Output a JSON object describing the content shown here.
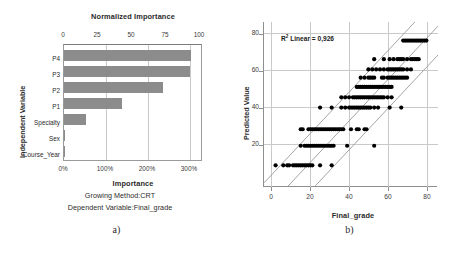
{
  "figure": {
    "panel_a_letter": "a)",
    "panel_b_letter": "b)"
  },
  "panel_a": {
    "top_axis_title": "Normalized Importance",
    "bottom_axis_title": "Importance",
    "y_axis_title": "Independent Variable",
    "caption_line1": "Growing Method:CRT",
    "caption_line2": "Dependent Variable:Final_grade",
    "top_ticks": [
      "0",
      "25",
      "50",
      "75",
      "100"
    ],
    "bottom_ticks": [
      "0%",
      "100%",
      "200%",
      "300%"
    ]
  },
  "panel_b": {
    "x_axis_title": "Final_grade",
    "y_axis_title": "Predicted Value",
    "r2_prefix": "R",
    "r2_sup": "2",
    "r2_text": " Linear = 0,926",
    "x_ticks": [
      "0",
      "20",
      "40",
      "60",
      "80"
    ],
    "y_ticks": [
      "20",
      "40",
      "60",
      "80"
    ]
  },
  "colors": {
    "bar_fill": "#8c8c8c",
    "grid": "#c9c9c9",
    "axis": "#8e8e8e",
    "point": "#000000",
    "text": "#2b2b2b"
  },
  "chart_data": [
    {
      "type": "bar",
      "title": "Normalized Importance",
      "orientation": "horizontal",
      "xlabel": "Importance",
      "ylabel": "Independent Variable",
      "secondary_xlabel": "Normalized Importance",
      "categories": [
        "P4",
        "P3",
        "P2",
        "P1",
        "Specialty",
        "Sex",
        "Course_Year"
      ],
      "values": [
        305,
        303,
        238,
        140,
        53,
        3,
        0
      ],
      "values_normalized": [
        100.0,
        99.3,
        78.0,
        45.9,
        17.4,
        1.0,
        0.0
      ],
      "xlim": [
        0,
        330
      ],
      "xticks": [
        0,
        100,
        200,
        300
      ],
      "xticklabels": [
        "0%",
        "100%",
        "200%",
        "300%"
      ],
      "secondary_xlim": [
        0,
        108
      ],
      "secondary_xticks": [
        0,
        25,
        50,
        75,
        100
      ],
      "secondary_xticklabels": [
        "0",
        "25",
        "50",
        "75",
        "100"
      ],
      "grid": "vertical",
      "legend": "none",
      "annotations": [
        "Growing Method:CRT",
        "Dependent Variable:Final_grade"
      ]
    },
    {
      "type": "scatter",
      "title": "",
      "xlabel": "Final_grade",
      "ylabel": "Predicted Value",
      "xlim": [
        -4,
        86
      ],
      "ylim": [
        8,
        88
      ],
      "xticks": [
        0,
        20,
        40,
        60,
        80
      ],
      "yticks": [
        20,
        40,
        60,
        80
      ],
      "grid": "both",
      "legend": "none",
      "annotation": "R2 Linear = 0,926",
      "r_squared": 0.926,
      "fit_line": {
        "slope": 1.0,
        "intercept": 0.0
      },
      "band_offsets": [
        -14,
        0,
        14
      ],
      "points": [
        [
          2,
          18.5
        ],
        [
          6,
          18.5
        ],
        [
          8,
          18.5
        ],
        [
          9,
          18.5
        ],
        [
          11,
          18.5
        ],
        [
          12,
          18.5
        ],
        [
          13,
          18.5
        ],
        [
          14,
          18.5
        ],
        [
          15,
          18.5
        ],
        [
          16,
          18.5
        ],
        [
          17,
          18.5
        ],
        [
          18,
          18.5
        ],
        [
          19,
          18.5
        ],
        [
          20,
          18.5
        ],
        [
          21,
          18.5
        ],
        [
          25,
          18.5
        ],
        [
          31,
          18.5
        ],
        [
          15,
          28
        ],
        [
          17,
          28
        ],
        [
          18,
          28
        ],
        [
          19,
          28
        ],
        [
          20,
          28
        ],
        [
          21,
          28
        ],
        [
          22,
          28
        ],
        [
          23,
          28
        ],
        [
          24,
          28
        ],
        [
          25,
          28
        ],
        [
          26,
          28
        ],
        [
          27,
          28
        ],
        [
          28,
          28
        ],
        [
          29,
          28
        ],
        [
          30,
          28
        ],
        [
          31,
          28
        ],
        [
          32,
          28
        ],
        [
          39,
          28
        ],
        [
          53,
          28
        ],
        [
          15,
          36
        ],
        [
          16,
          36
        ],
        [
          19,
          36
        ],
        [
          20,
          36
        ],
        [
          21,
          36
        ],
        [
          22,
          36
        ],
        [
          23,
          36
        ],
        [
          24,
          36
        ],
        [
          25,
          36
        ],
        [
          26,
          36
        ],
        [
          27,
          36
        ],
        [
          28,
          36
        ],
        [
          29,
          36
        ],
        [
          30,
          36
        ],
        [
          31,
          36
        ],
        [
          32,
          36
        ],
        [
          33,
          36
        ],
        [
          34,
          36
        ],
        [
          35,
          36
        ],
        [
          36,
          36
        ],
        [
          37,
          36
        ],
        [
          41,
          36
        ],
        [
          44,
          36
        ],
        [
          45,
          36
        ],
        [
          48,
          36
        ],
        [
          49,
          36
        ],
        [
          25,
          46.5
        ],
        [
          31,
          46.5
        ],
        [
          36,
          46.5
        ],
        [
          38,
          46.5
        ],
        [
          40,
          46.5
        ],
        [
          41,
          46.5
        ],
        [
          42,
          46.5
        ],
        [
          43,
          46.5
        ],
        [
          44,
          46.5
        ],
        [
          45,
          46.5
        ],
        [
          46,
          46.5
        ],
        [
          47,
          46.5
        ],
        [
          48,
          46.5
        ],
        [
          49,
          46.5
        ],
        [
          50,
          46.5
        ],
        [
          51,
          46.5
        ],
        [
          53,
          46.5
        ],
        [
          55,
          46.5
        ],
        [
          61,
          46.5
        ],
        [
          67,
          46.5
        ],
        [
          36,
          51.5
        ],
        [
          38,
          51.5
        ],
        [
          40,
          51.5
        ],
        [
          42,
          51.5
        ],
        [
          43,
          51.5
        ],
        [
          44,
          51.5
        ],
        [
          45,
          51.5
        ],
        [
          46,
          51.5
        ],
        [
          47,
          51.5
        ],
        [
          48,
          51.5
        ],
        [
          49,
          51.5
        ],
        [
          50,
          51.5
        ],
        [
          51,
          51.5
        ],
        [
          52,
          51.5
        ],
        [
          53,
          51.5
        ],
        [
          54,
          51.5
        ],
        [
          55,
          51.5
        ],
        [
          56,
          51.5
        ],
        [
          57,
          51.5
        ],
        [
          58,
          51.5
        ],
        [
          60,
          51.5
        ],
        [
          62,
          51.5
        ],
        [
          44,
          56.5
        ],
        [
          45,
          56.5
        ],
        [
          46,
          56.5
        ],
        [
          47,
          56.5
        ],
        [
          48,
          56.5
        ],
        [
          49,
          56.5
        ],
        [
          50,
          56.5
        ],
        [
          51,
          56.5
        ],
        [
          52,
          56.5
        ],
        [
          53,
          56.5
        ],
        [
          54,
          56.5
        ],
        [
          55,
          56.5
        ],
        [
          56,
          56.5
        ],
        [
          57,
          56.5
        ],
        [
          58,
          56.5
        ],
        [
          59,
          56.5
        ],
        [
          60,
          56.5
        ],
        [
          61,
          56.5
        ],
        [
          62,
          56.5
        ],
        [
          46,
          61
        ],
        [
          48,
          61
        ],
        [
          50,
          61
        ],
        [
          51,
          61
        ],
        [
          52,
          61
        ],
        [
          53,
          61
        ],
        [
          57,
          61
        ],
        [
          58,
          61
        ],
        [
          60,
          61
        ],
        [
          61,
          61
        ],
        [
          62,
          61
        ],
        [
          63,
          61
        ],
        [
          64,
          61
        ],
        [
          65,
          61
        ],
        [
          66,
          61
        ],
        [
          67,
          61
        ],
        [
          68,
          61
        ],
        [
          69,
          61
        ],
        [
          70,
          61
        ],
        [
          50,
          65
        ],
        [
          52,
          65
        ],
        [
          54,
          65
        ],
        [
          56,
          65
        ],
        [
          58,
          65
        ],
        [
          60,
          65
        ],
        [
          61,
          65
        ],
        [
          62,
          65
        ],
        [
          63,
          65
        ],
        [
          64,
          65
        ],
        [
          65,
          65
        ],
        [
          66,
          65
        ],
        [
          67,
          65
        ],
        [
          68,
          65
        ],
        [
          70,
          65
        ],
        [
          72,
          65
        ],
        [
          53,
          70
        ],
        [
          58,
          70
        ],
        [
          61,
          70
        ],
        [
          63,
          70
        ],
        [
          65,
          70
        ],
        [
          66,
          70
        ],
        [
          67,
          70
        ],
        [
          68,
          70
        ],
        [
          70,
          70
        ],
        [
          72,
          70
        ],
        [
          73,
          70
        ],
        [
          74,
          70
        ],
        [
          75,
          70
        ],
        [
          76,
          70
        ],
        [
          68,
          79
        ],
        [
          69,
          79
        ],
        [
          70,
          79
        ],
        [
          71,
          79
        ],
        [
          72,
          79
        ],
        [
          73,
          79
        ],
        [
          74,
          79
        ],
        [
          75,
          79
        ],
        [
          76,
          79
        ],
        [
          77,
          79
        ],
        [
          78,
          79
        ],
        [
          79,
          79
        ],
        [
          80,
          79
        ]
      ]
    }
  ]
}
